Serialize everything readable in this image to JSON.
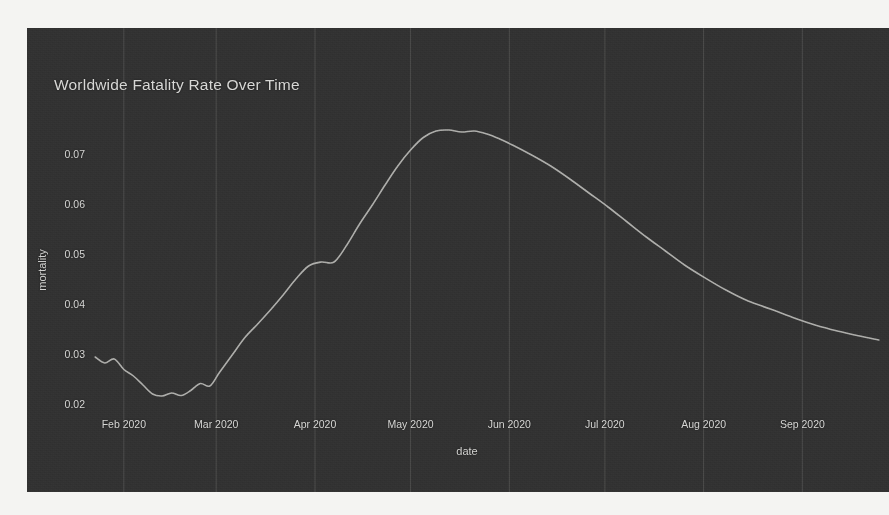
{
  "chart_data": {
    "type": "line",
    "title": "Worldwide Fatality Rate Over Time",
    "xlabel": "date",
    "ylabel": "mortality",
    "grid": "vertical-only",
    "legend": "none",
    "line_color": "#b9b9b5",
    "background_color": "#323232",
    "text_color": "#d6d6d4",
    "ylim": [
      0.0195,
      0.0785
    ],
    "yticks": [
      "0.02",
      "0.03",
      "0.04",
      "0.05",
      "0.06",
      "0.07"
    ],
    "ytick_values": [
      0.02,
      0.03,
      0.04,
      0.05,
      0.06,
      0.07
    ],
    "xticks": [
      "Feb 2020",
      "Mar 2020",
      "Apr 2020",
      "May 2020",
      "Jun 2020",
      "Jul 2020",
      "Aug 2020",
      "Sep 2020"
    ],
    "xlim": [
      "2020-01-22",
      "2020-09-26"
    ],
    "x": [
      "2020-01-23",
      "2020-01-26",
      "2020-01-29",
      "2020-02-01",
      "2020-02-04",
      "2020-02-07",
      "2020-02-10",
      "2020-02-13",
      "2020-02-16",
      "2020-02-19",
      "2020-02-22",
      "2020-02-25",
      "2020-02-28",
      "2020-03-02",
      "2020-03-06",
      "2020-03-10",
      "2020-03-14",
      "2020-03-18",
      "2020-03-22",
      "2020-03-26",
      "2020-03-30",
      "2020-04-03",
      "2020-04-07",
      "2020-04-11",
      "2020-04-15",
      "2020-04-19",
      "2020-04-23",
      "2020-04-27",
      "2020-05-01",
      "2020-05-05",
      "2020-05-09",
      "2020-05-13",
      "2020-05-17",
      "2020-05-21",
      "2020-05-25",
      "2020-05-29",
      "2020-06-02",
      "2020-06-08",
      "2020-06-14",
      "2020-06-20",
      "2020-06-26",
      "2020-07-02",
      "2020-07-08",
      "2020-07-14",
      "2020-07-20",
      "2020-07-26",
      "2020-08-01",
      "2020-08-08",
      "2020-08-15",
      "2020-08-22",
      "2020-08-29",
      "2020-09-05",
      "2020-09-12",
      "2020-09-19",
      "2020-09-25"
    ],
    "values": [
      0.0296,
      0.0284,
      0.0292,
      0.0271,
      0.0258,
      0.024,
      0.0222,
      0.0218,
      0.0224,
      0.0219,
      0.0229,
      0.0243,
      0.0238,
      0.0265,
      0.03,
      0.0335,
      0.0362,
      0.039,
      0.042,
      0.0452,
      0.0478,
      0.0486,
      0.0486,
      0.052,
      0.0562,
      0.06,
      0.064,
      0.0678,
      0.071,
      0.0735,
      0.0748,
      0.075,
      0.0746,
      0.0748,
      0.0742,
      0.0732,
      0.072,
      0.07,
      0.0678,
      0.0652,
      0.0624,
      0.0596,
      0.0566,
      0.0536,
      0.0508,
      0.048,
      0.0456,
      0.043,
      0.0408,
      0.0392,
      0.0375,
      0.036,
      0.0348,
      0.0338,
      0.033
    ],
    "annotations": {
      "peak_value": 0.075,
      "peak_date": "2020-05-13",
      "trough_value": 0.0218,
      "trough_date": "2020-02-13",
      "start_value": 0.0296,
      "end_value": 0.033
    }
  }
}
